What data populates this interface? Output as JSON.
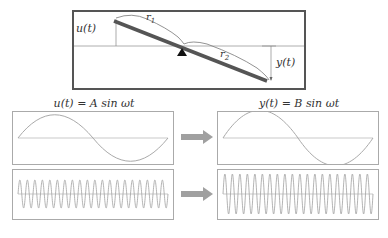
{
  "lever": {
    "input_label": "u(t)",
    "output_label": "y(t)",
    "arm1_label": "r",
    "arm1_sub": "1",
    "arm2_label": "r",
    "arm2_sub": "2",
    "colors": {
      "bar": "#555555",
      "fulcrum": "#111111",
      "guide": "#888888",
      "border": "#555555"
    }
  },
  "input_signal": {
    "title": "u(t) = A sin ωt",
    "low_freq_cycles": 1,
    "high_freq_cycles": 20
  },
  "output_signal": {
    "title": "y(t) = B sin ωt",
    "low_freq_cycles": 1,
    "high_freq_cycles": 20
  },
  "arrows": [
    {
      "direction": "right",
      "color": "#a0a0a0"
    },
    {
      "direction": "right",
      "color": "#a0a0a0"
    }
  ],
  "caption": ""
}
